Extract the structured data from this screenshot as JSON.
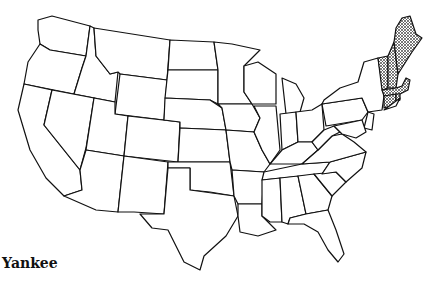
{
  "map": {
    "title": "Yankee",
    "subtitle": "",
    "region_highlight": "New England",
    "highlighted_states": [
      "Maine",
      "New Hampshire",
      "Vermont",
      "Massachusetts",
      "Connecticut",
      "Rhode Island"
    ],
    "highlight_pattern": "cross-hatch",
    "colors": {
      "stroke": "#111111",
      "fill": "#ffffff",
      "highlight": "#555555"
    }
  }
}
